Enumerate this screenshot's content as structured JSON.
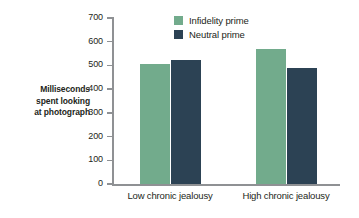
{
  "chart_data": {
    "type": "bar",
    "title": "",
    "xlabel": "",
    "ylabel": "Milliseconds spent looking at photograph",
    "ylabel_lines": [
      "Milliseconds",
      "spent looking",
      "at photograph"
    ],
    "categories": [
      "Low chronic jealousy",
      "High chronic jealousy"
    ],
    "series": [
      {
        "name": "Infidelity prime",
        "color": "#72ab8c",
        "values": [
          505,
          570
        ]
      },
      {
        "name": "Neutral prime",
        "color": "#2c4254",
        "values": [
          525,
          490
        ]
      }
    ],
    "ylim": [
      0,
      700
    ],
    "yticks": [
      0,
      100,
      200,
      300,
      400,
      500,
      600,
      700
    ],
    "ytick_labels": [
      "0",
      "100",
      "200",
      "300",
      "400",
      "500",
      "600",
      "700"
    ],
    "grid": false,
    "legend_position": "top-center",
    "axis_color": "#8f9194",
    "background": "#ffffff"
  }
}
